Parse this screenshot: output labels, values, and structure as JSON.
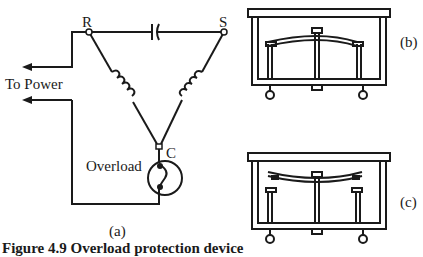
{
  "circuit": {
    "node_r": "R",
    "node_s": "S",
    "node_c": "C",
    "power_label": "To Power",
    "overload_label": "Overload",
    "panel_label": "(a)"
  },
  "devices": {
    "b_label": "(b)",
    "c_label": "(c)"
  },
  "caption": "Figure 4.9  Overload protection device",
  "colors": {
    "line": "#1a1a1a",
    "background": "#ffffff"
  }
}
